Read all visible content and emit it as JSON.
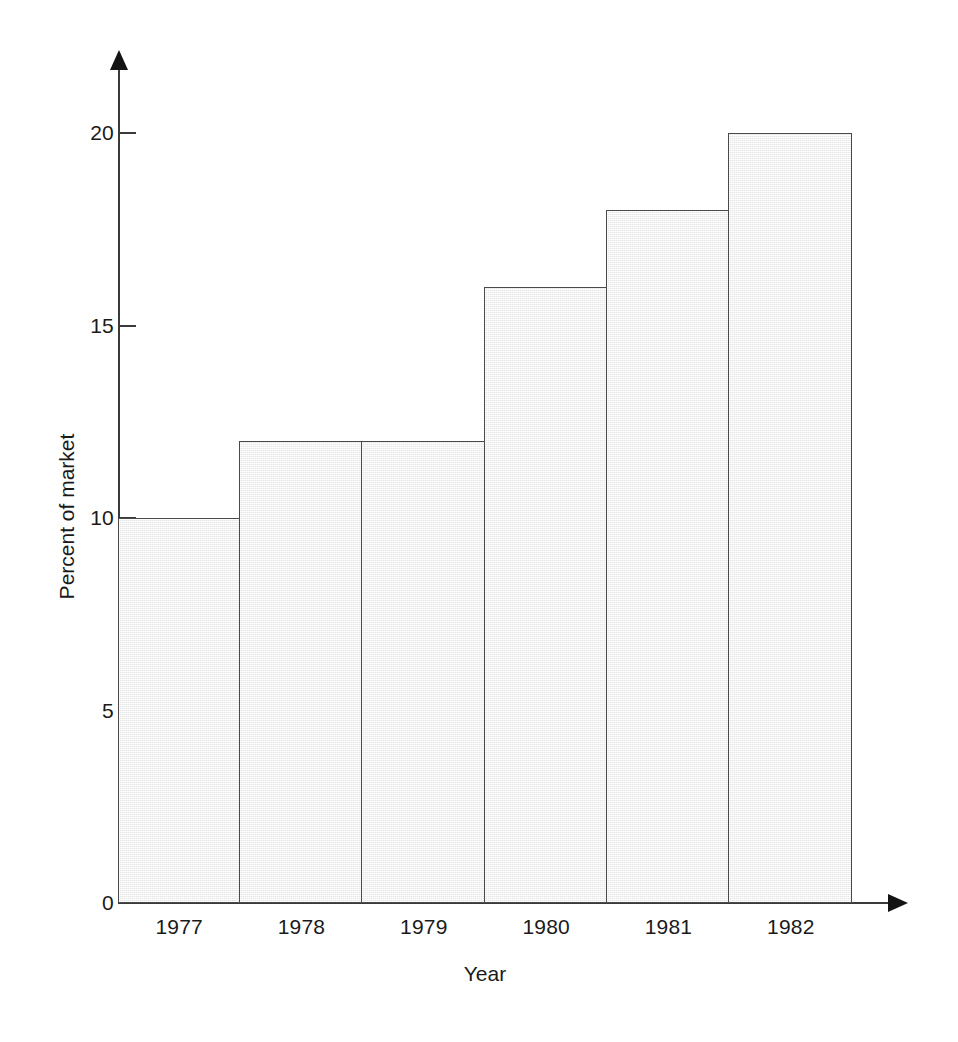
{
  "chart_data": {
    "type": "bar",
    "title": "",
    "xlabel": "Year",
    "ylabel": "Percent of market",
    "categories": [
      "1977",
      "1978",
      "1979",
      "1980",
      "1981",
      "1982"
    ],
    "values": [
      10,
      12,
      12,
      16,
      18,
      20
    ],
    "ylim": [
      0,
      21.7
    ],
    "yticks": [
      0,
      5,
      10,
      15,
      20
    ],
    "ytick_labels": [
      "0",
      "5",
      "10",
      "15",
      "20"
    ],
    "grid": false,
    "legend": null,
    "series": [
      {
        "name": "Percent of market",
        "values": [
          10,
          12,
          12,
          16,
          18,
          20
        ]
      }
    ],
    "bar_fill_color": "#e6e6e6",
    "bar_border_color": "#4a4a4a",
    "axis_color": "#3a3a3a",
    "background_color": "#ffffff",
    "axis_arrows": true,
    "bar_gap": 0
  }
}
